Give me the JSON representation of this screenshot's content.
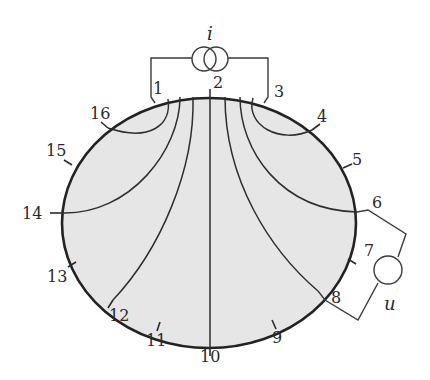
{
  "diagram": {
    "current_source_label": "i",
    "voltage_meter_label": "u",
    "electrodes": [
      {
        "id": 1,
        "label": "1",
        "x": 163,
        "y": 100,
        "lx": 153,
        "ly": 94
      },
      {
        "id": 2,
        "label": "2",
        "x": 210,
        "y": 97,
        "lx": 213,
        "ly": 88
      },
      {
        "id": 3,
        "label": "3",
        "x": 268,
        "y": 100,
        "lx": 274,
        "ly": 97
      },
      {
        "id": 4,
        "label": "4",
        "x": 312,
        "y": 130,
        "lx": 317,
        "ly": 122
      },
      {
        "id": 5,
        "label": "5",
        "x": 343,
        "y": 168,
        "lx": 352,
        "ly": 165
      },
      {
        "id": 6,
        "label": "6",
        "x": 357,
        "y": 212,
        "lx": 372,
        "ly": 208
      },
      {
        "id": 7,
        "label": "7",
        "x": 348,
        "y": 259,
        "lx": 364,
        "ly": 256
      },
      {
        "id": 8,
        "label": "8",
        "x": 318,
        "y": 291,
        "lx": 331,
        "ly": 303
      },
      {
        "id": 9,
        "label": "9",
        "x": 272,
        "y": 320,
        "lx": 272,
        "ly": 343
      },
      {
        "id": 10,
        "label": "10",
        "x": 210,
        "y": 348,
        "lx": 200,
        "ly": 362
      },
      {
        "id": 11,
        "label": "11",
        "x": 160,
        "y": 322,
        "lx": 146,
        "ly": 346
      },
      {
        "id": 12,
        "label": "12",
        "x": 113,
        "y": 300,
        "lx": 109,
        "ly": 321
      },
      {
        "id": 13,
        "label": "13",
        "x": 76,
        "y": 262,
        "lx": 47,
        "ly": 282
      },
      {
        "id": 14,
        "label": "14",
        "x": 62,
        "y": 213,
        "lx": 22,
        "ly": 219
      },
      {
        "id": 15,
        "label": "15",
        "x": 72,
        "y": 165,
        "lx": 46,
        "ly": 156
      },
      {
        "id": 16,
        "label": "16",
        "x": 108,
        "y": 128,
        "lx": 90,
        "ly": 119
      }
    ],
    "colors": {
      "body_fill": "#e6e6e6",
      "outline": "#222222",
      "lines": "#2e2e2e"
    }
  }
}
